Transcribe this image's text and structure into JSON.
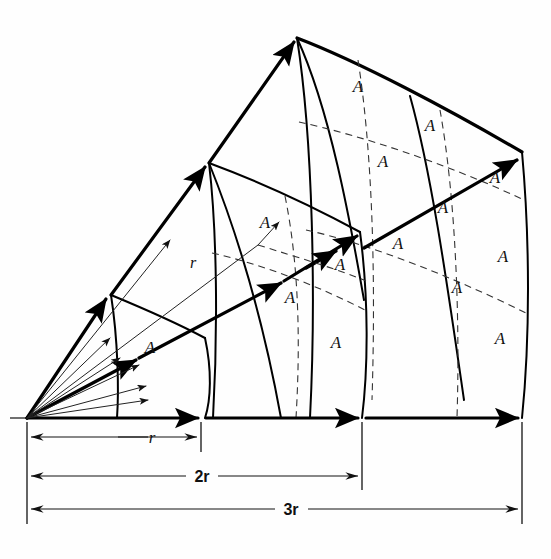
{
  "figure": {
    "page_number": "",
    "source_label": "point source",
    "area_label": "A",
    "radius_label": "r",
    "dimensions": [
      {
        "id": "dim-r",
        "label": "r",
        "x_start": 38,
        "x_end": 200,
        "y": 437
      },
      {
        "id": "dim-2r",
        "label": "2r",
        "x_start": 38,
        "x_end": 362,
        "y": 476
      },
      {
        "id": "dim-3r",
        "label": "3r",
        "x_start": 38,
        "x_end": 522,
        "y": 509
      }
    ],
    "shells": [
      {
        "id": "shell-1",
        "distance": "r",
        "patch_count": 1,
        "area_multiple": 1
      },
      {
        "id": "shell-2",
        "distance": "2r",
        "patch_count": 4,
        "area_multiple": 4
      },
      {
        "id": "shell-3",
        "distance": "3r",
        "patch_count": 9,
        "area_multiple": 9
      }
    ],
    "area_labels": [
      {
        "id": "A-s1-1",
        "x": 150,
        "y": 353,
        "shell": "shell-1"
      },
      {
        "id": "A-s2-1",
        "x": 265,
        "y": 228,
        "shell": "shell-2"
      },
      {
        "id": "A-s2-2",
        "x": 340,
        "y": 270,
        "shell": "shell-2"
      },
      {
        "id": "A-s2-3",
        "x": 290,
        "y": 303,
        "shell": "shell-2"
      },
      {
        "id": "A-s2-4",
        "x": 336,
        "y": 348,
        "shell": "shell-2"
      },
      {
        "id": "A-s3-1",
        "x": 358,
        "y": 92,
        "shell": "shell-3"
      },
      {
        "id": "A-s3-2",
        "x": 430,
        "y": 131,
        "shell": "shell-3"
      },
      {
        "id": "A-s3-3",
        "x": 383,
        "y": 167,
        "shell": "shell-3"
      },
      {
        "id": "A-s3-4",
        "x": 495,
        "y": 183,
        "shell": "shell-3"
      },
      {
        "id": "A-s3-5",
        "x": 443,
        "y": 213,
        "shell": "shell-3"
      },
      {
        "id": "A-s3-6",
        "x": 398,
        "y": 249,
        "shell": "shell-3"
      },
      {
        "id": "A-s3-7",
        "x": 503,
        "y": 262,
        "shell": "shell-3"
      },
      {
        "id": "A-s3-8",
        "x": 457,
        "y": 293,
        "shell": "shell-3"
      },
      {
        "id": "A-s3-9",
        "x": 500,
        "y": 344,
        "shell": "shell-3"
      }
    ],
    "colors": {
      "ink": "#000000",
      "background": "#ffffff",
      "dashed": "#333333",
      "thin": "#222222"
    },
    "geometry": {
      "source_x": 27,
      "source_y": 418,
      "baseline_y": 418,
      "apex_top_x": 297,
      "apex_top_y": 38,
      "tick_x": [
        27,
        200,
        362,
        522
      ]
    }
  }
}
